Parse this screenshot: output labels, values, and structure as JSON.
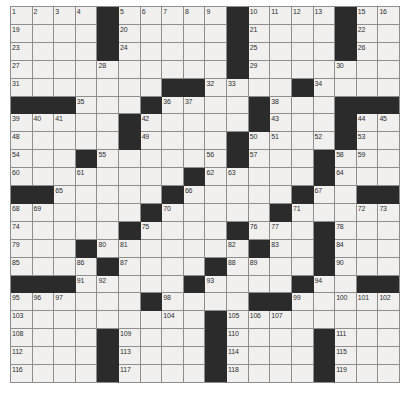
{
  "puzzle": {
    "title": "Crossword Grid",
    "type": "crossword",
    "columns": 18,
    "rows": 17,
    "cell_size_px": 21.67,
    "grid_origin": {
      "x": 10,
      "y": 6
    },
    "colors": {
      "page_background": "#ffffff",
      "cell_fill": "#f1f0ee",
      "block_fill": "#2b2b2b",
      "grid_line": "#8e8e8e",
      "number_text": "#2e2e2e"
    },
    "clue_count": 119,
    "highest_number": 119,
    "block_char": "#",
    "open_char": ".",
    "layout_rows": [
      "....#.....#.....#.",
      "....#.....#.....#.",
      "....#.....#.....#.",
      "....................",
      "..............#....",
      "###...#......#......",
      "...#.........#....",
      "....#....#........",
      "...#.....#.......#",
      "...#......#..#....",
      "##.....#.......###",
      "......#......#..##",
      ".....#....##......",
      "...#.#.......#....",
      "##..#.....#..#..##",
      "......#....###....",
      "......#...#.......",
      "....#........#....",
      "....#........#....",
      "....#........#...."
    ],
    "grid": [
      [
        "o1",
        "o2",
        "o3",
        "o4",
        "b",
        "o5",
        "o6",
        "o7",
        "o8",
        "o9",
        "b",
        "o10",
        "o11",
        "o12",
        "o13",
        "o14",
        "b",
        "o15",
        "o16",
        "o17",
        "o18"
      ],
      [
        "note",
        "Row arrays are authoritative in grid_rows below"
      ]
    ],
    "grid_rows": [
      {
        "row": 1,
        "blocks": [
          4,
          9,
          14
        ],
        "numbers": {
          "0": 1,
          "1": 2,
          "2": 3,
          "3": 4,
          "5": 5,
          "6": 6,
          "7": 7,
          "8": 8,
          "9": 9,
          "10": 10,
          "11": 11,
          "12": 12,
          "13": 13,
          "15": 15,
          "16": 16,
          "17": 17
        }
      },
      {
        "row": 1.5,
        "note": "col 14 numbered 14 sits before the block at col 14"
      },
      {
        "row": 2,
        "blocks": [
          4,
          9,
          14
        ],
        "numbers": {
          "0": 19,
          "5": 20,
          "10": 21,
          "15": 22
        }
      },
      {
        "row": 3,
        "blocks": [
          4,
          9,
          14
        ],
        "numbers": {
          "0": 23,
          "5": 24,
          "10": 25,
          "15": 26
        }
      },
      {
        "row": 4,
        "blocks": [],
        "numbers": {
          "0": 27,
          "4": 28,
          "10": 29,
          "14": 30
        }
      },
      {
        "row": 5,
        "blocks": [
          7,
          8,
          12
        ],
        "numbers": {
          "0": 31,
          "9": 32,
          "10": 33,
          "13": 34
        }
      },
      {
        "row": 6,
        "blocks": [
          0,
          1,
          2,
          6,
          11,
          15,
          16,
          17
        ],
        "numbers": {
          "3": 35,
          "7": 36,
          "8": 37,
          "12": 38
        }
      },
      {
        "row": 7,
        "blocks": [
          4,
          10,
          14
        ],
        "numbers": {
          "0": 39,
          "1": 40,
          "2": 41,
          "5": 42,
          "11": 43,
          "15": 44,
          "16": 45,
          "17": 46
        }
      },
      {
        "row": 8,
        "blocks": [
          4,
          9,
          14
        ],
        "numbers": {
          "0": 48,
          "5": 49,
          "10": 50,
          "11": 51,
          "13": 52,
          "15": 53
        }
      },
      {
        "row": 9,
        "blocks": [
          3,
          9,
          13
        ],
        "numbers": {
          "0": 54,
          "4": 55,
          "8": 56,
          "10": 57,
          "14": 58,
          "15": 59
        }
      },
      {
        "row": 10,
        "blocks": [
          8,
          13
        ],
        "numbers": {
          "0": 60,
          "3": 61,
          "9": 62,
          "10": 63,
          "14": 64
        }
      },
      {
        "row": 11,
        "blocks": [
          0,
          1,
          7,
          12,
          16,
          17
        ],
        "numbers": {
          "2": 65,
          "8": 66,
          "13": 67
        }
      },
      {
        "row": 12,
        "blocks": [
          6,
          12
        ],
        "numbers": {
          "0": 68,
          "1": 69,
          "7": 70,
          "13": 71,
          "16": 72,
          "17": 73
        }
      },
      {
        "row": 13,
        "blocks": [
          5,
          10,
          15
        ],
        "numbers": {
          "0": 74,
          "6": 75,
          "11": 76,
          "12": 77,
          "16": 78
        }
      },
      {
        "row": 14,
        "blocks": [
          3,
          10,
          14
        ],
        "numbers": {
          "0": 79,
          "4": 80,
          "5": 81,
          "11": 82,
          "12": 83,
          "15": 84
        }
      },
      {
        "row": 15,
        "blocks": [
          4,
          9,
          14
        ],
        "numbers": {
          "0": 85,
          "3": 86,
          "5": 87,
          "10": 88,
          "11": 89,
          "15": 90
        }
      },
      {
        "row": 16,
        "blocks": [
          0,
          1,
          2,
          8,
          13,
          16,
          17
        ],
        "numbers": {
          "3": 91,
          "4": 92,
          "9": 93,
          "14": 94
        }
      },
      {
        "row": 17,
        "blocks": [
          6,
          11,
          12
        ],
        "numbers": {
          "0": 95,
          "1": 96,
          "2": 97,
          "7": 98,
          "13": 99,
          "15": 100,
          "16": 101,
          "17": 102
        }
      },
      {
        "row": 18,
        "blocks": [
          10
        ],
        "numbers": {
          "0": 103,
          "7": 104,
          "11": 105,
          "12": 106,
          "13": 107
        }
      },
      {
        "row": 19,
        "blocks": [
          4,
          10,
          15
        ],
        "numbers": {
          "0": 108,
          "5": 109,
          "11": 110,
          "16": 111
        }
      },
      {
        "row": 20,
        "blocks": [
          4,
          10,
          15
        ],
        "numbers": {
          "0": 112,
          "5": 113,
          "11": 114,
          "16": 115
        }
      },
      {
        "row": 21,
        "blocks": [
          4,
          10,
          15
        ],
        "numbers": {
          "0": 116,
          "5": 117,
          "11": 118,
          "16": 119
        }
      }
    ],
    "cells": [
      [
        {
          "n": 1
        },
        {
          "n": 2
        },
        {
          "n": 3
        },
        {
          "n": 4
        },
        {
          "b": true
        },
        {
          "n": 5
        },
        {
          "n": 6
        },
        {
          "n": 7
        },
        {
          "n": 8
        },
        {
          "n": 9
        },
        {
          "b": true
        },
        {
          "n": 10
        },
        {
          "n": 11
        },
        {
          "n": 12
        },
        {
          "n": 13
        },
        {
          "n": 14
        },
        {
          "b": true
        },
        {
          "n": 15
        },
        {
          "n": 16
        },
        {
          "n": 17
        },
        {
          "n": 18
        }
      ],
      [
        {
          "n": 19
        },
        {},
        {},
        {},
        {
          "b": true
        },
        {
          "n": 20
        },
        {},
        {},
        {},
        {},
        {
          "b": true
        },
        {
          "n": 21
        },
        {},
        {},
        {},
        {},
        {
          "b": true
        },
        {
          "n": 22
        },
        {},
        {},
        {}
      ],
      [
        {
          "n": 23
        },
        {},
        {},
        {},
        {
          "b": true
        },
        {
          "n": 24
        },
        {},
        {},
        {},
        {},
        {
          "b": true
        },
        {
          "n": 25
        },
        {},
        {},
        {},
        {},
        {
          "b": true
        },
        {
          "n": 26
        },
        {},
        {},
        {}
      ],
      [
        {
          "n": 27
        },
        {},
        {},
        {},
        {
          "n": 28
        },
        {},
        {},
        {},
        {},
        {},
        {
          "b": true
        },
        {
          "n": 29
        },
        {},
        {},
        {},
        {
          "n": 30
        },
        {},
        {},
        {},
        {},
        {}
      ],
      [
        {
          "n": 31
        },
        {},
        {},
        {},
        {},
        {},
        {},
        {
          "b": true
        },
        {
          "b": true
        },
        {
          "n": 32
        },
        {
          "n": 33
        },
        {},
        {},
        {
          "b": true
        },
        {
          "n": 34
        },
        {},
        {},
        {},
        {},
        {},
        {}
      ],
      [
        {
          "b": true
        },
        {
          "b": true
        },
        {
          "b": true
        },
        {
          "n": 35
        },
        {},
        {},
        {
          "b": true
        },
        {
          "n": 36
        },
        {
          "n": 37
        },
        {},
        {},
        {},
        {
          "b": true
        },
        {
          "n": 38
        },
        {},
        {},
        {},
        {
          "b": true
        },
        {
          "b": true
        },
        {
          "b": true
        },
        {
          "b": true
        }
      ],
      [
        {
          "n": 39
        },
        {
          "n": 40
        },
        {
          "n": 41
        },
        {},
        {},
        {
          "b": true
        },
        {
          "n": 42
        },
        {},
        {},
        {},
        {},
        {
          "b": true
        },
        {
          "n": 43
        },
        {},
        {},
        {},
        {
          "b": true
        },
        {
          "n": 44
        },
        {
          "n": 45
        },
        {
          "n": 46
        },
        {
          "n": 47
        }
      ],
      [
        {
          "n": 48
        },
        {},
        {},
        {},
        {},
        {
          "b": true
        },
        {
          "n": 49
        },
        {},
        {},
        {},
        {
          "b": true
        },
        {
          "n": 50
        },
        {
          "n": 51
        },
        {},
        {},
        {},
        {
          "n": 52
        },
        {
          "b": true
        },
        {
          "n": 53
        },
        {},
        {},
        {}
      ],
      [
        {
          "n": 54
        },
        {},
        {},
        {},
        {
          "b": true
        },
        {
          "n": 55
        },
        {},
        {},
        {},
        {},
        {
          "n": 56
        },
        {
          "b": true
        },
        {
          "n": 57
        },
        {},
        {},
        {},
        {
          "b": true
        },
        {
          "n": 58
        },
        {
          "n": 59
        },
        {},
        {},
        {}
      ],
      [
        {
          "n": 60
        },
        {},
        {},
        {},
        {
          "n": 61
        },
        {},
        {},
        {},
        {},
        {
          "b": true
        },
        {
          "n": 62
        },
        {
          "n": 63
        },
        {},
        {},
        {},
        {
          "b": true
        },
        {
          "n": 64
        },
        {},
        {},
        {},
        {}
      ],
      [
        {
          "b": true
        },
        {
          "b": true
        },
        {
          "b": true
        },
        {
          "n": 65
        },
        {},
        {},
        {},
        {},
        {},
        {
          "b": true
        },
        {
          "n": 66
        },
        {},
        {},
        {},
        {},
        {
          "b": true
        },
        {
          "n": 67
        },
        {},
        {},
        {},
        {
          "b": true
        }
      ],
      [
        {
          "n": 68
        },
        {
          "n": 69
        },
        {},
        {},
        {},
        {},
        {},
        {
          "b": true
        },
        {
          "n": 70
        },
        {},
        {},
        {},
        {},
        {
          "b": true
        },
        {
          "n": 71
        },
        {},
        {},
        {},
        {},
        {
          "n": 72
        },
        {
          "n": 73
        }
      ],
      [
        {
          "n": 74
        },
        {},
        {},
        {},
        {},
        {},
        {
          "b": true
        },
        {
          "n": 75
        },
        {},
        {},
        {},
        {
          "b": true
        },
        {
          "n": 76
        },
        {
          "n": 77
        },
        {},
        {},
        {},
        {},
        {
          "b": true
        },
        {
          "n": 78
        },
        {}
      ],
      [
        {
          "n": 79
        },
        {},
        {},
        {
          "b": true
        },
        {
          "n": 80
        },
        {
          "n": 81
        },
        {},
        {},
        {},
        {},
        {},
        {
          "n": 82
        },
        {
          "b": true
        },
        {
          "n": 83
        },
        {},
        {},
        {},
        {
          "b": true
        },
        {
          "n": 84
        },
        {},
        {}
      ],
      [
        {
          "n": 85
        },
        {},
        {},
        {
          "n": 86
        },
        {
          "b": true
        },
        {
          "n": 87
        },
        {},
        {},
        {},
        {},
        {
          "b": true
        },
        {
          "n": 88
        },
        {
          "n": 89
        },
        {},
        {},
        {},
        {
          "b": true
        },
        {
          "n": 90
        },
        {},
        {},
        {}
      ],
      [
        {
          "b": true
        },
        {
          "b": true
        },
        {
          "b": true
        },
        {
          "n": 91
        },
        {
          "n": 92
        },
        {},
        {},
        {},
        {
          "b": true
        },
        {
          "n": 93
        },
        {},
        {},
        {},
        {},
        {
          "b": true
        },
        {
          "n": 94
        },
        {},
        {},
        {
          "b": true
        },
        {
          "b": true
        },
        {
          "b": true
        }
      ],
      [
        {
          "n": 95
        },
        {
          "n": 96
        },
        {
          "n": 97
        },
        {},
        {},
        {},
        {
          "b": true
        },
        {
          "n": 98
        },
        {},
        {},
        {},
        {
          "b": true
        },
        {
          "b": true
        },
        {
          "n": 99
        },
        {},
        {},
        {},
        {
          "n": 100
        },
        {
          "n": 101
        },
        {
          "n": 102
        },
        {}
      ]
    ],
    "footer_note": ""
  }
}
